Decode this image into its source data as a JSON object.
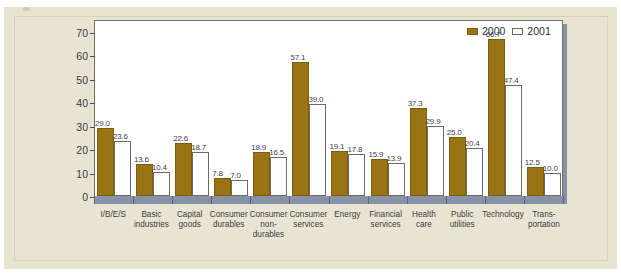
{
  "chart_data": {
    "type": "bar",
    "title": "",
    "xlabel": "",
    "ylabel": "",
    "ylim": [
      0,
      75
    ],
    "yticks": [
      0,
      10,
      20,
      30,
      40,
      50,
      60,
      70
    ],
    "grid": false,
    "legend_position": "top-right",
    "categories": [
      "I/B/E/S",
      "Basic industries",
      "Capital goods",
      "Consumer durables",
      "Consumer non-durables",
      "Consumer services",
      "Energy",
      "Financial services",
      "Health care",
      "Public utilities",
      "Technology",
      "Trans-portation"
    ],
    "category_lines": [
      [
        "I/B/E/S"
      ],
      [
        "Basic",
        "industries"
      ],
      [
        "Capital",
        "goods"
      ],
      [
        "Consumer",
        "durables"
      ],
      [
        "Consumer",
        "non-",
        "durables"
      ],
      [
        "Consumer",
        "services"
      ],
      [
        "Energy"
      ],
      [
        "Financial",
        "services"
      ],
      [
        "Health",
        "care"
      ],
      [
        "Public",
        "utilities"
      ],
      [
        "Technology"
      ],
      [
        "Trans-",
        "portation"
      ]
    ],
    "series": [
      {
        "name": "2000",
        "color": "#9a7414",
        "values": [
          29.0,
          13.6,
          22.6,
          7.8,
          18.9,
          57.1,
          19.1,
          15.9,
          37.3,
          25.0,
          66.7,
          12.5
        ],
        "labels": [
          "29.0",
          "13.6",
          "22.6",
          "7.8",
          "18.9",
          "57.1",
          "19.1",
          "15.9",
          "37.3",
          "25.0",
          "66.7",
          "12.5"
        ]
      },
      {
        "name": "2001",
        "color": "#ffffff",
        "values": [
          23.6,
          10.4,
          18.7,
          7.0,
          16.5,
          39.0,
          17.8,
          13.9,
          29.9,
          20.4,
          47.4,
          10.0
        ],
        "labels": [
          "23.6",
          "10.4",
          "18.7",
          "7.0",
          "16.5",
          "39.0",
          "17.8",
          "13.9",
          "29.9",
          "20.4",
          "47.4",
          "10.0"
        ]
      }
    ]
  },
  "legend": {
    "entries": [
      {
        "label": "2000",
        "style": "filled"
      },
      {
        "label": "2001",
        "style": "open"
      }
    ]
  },
  "colors": {
    "bar_2000": "#9a7414",
    "bar_2001": "#ffffff",
    "background": "#e9e4d1",
    "plot_background": "#ffffff",
    "shadow": "#8892a6",
    "axis_text": "#3a3a44"
  }
}
